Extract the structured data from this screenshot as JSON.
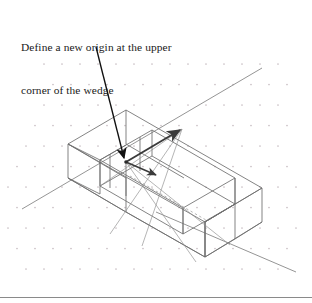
{
  "figure": {
    "kind": "isometric-wireframe-drawing",
    "width": 312,
    "height": 303,
    "background_color": "#ffffff",
    "annotation": {
      "line1": "Define a new origin at the upper",
      "line2": "corner of the wedge",
      "text_color": "#1a1a1a",
      "font_size_px": 11.4
    },
    "colors": {
      "solid_edge": "#4a4a4a",
      "thin_edge": "#7a7a7a",
      "hidden_edge": "#9a9a9a",
      "grid_dot": "#c9bfc4",
      "leader": "#111111",
      "ucs_axis": "#3a3a3a",
      "frame_rule": "#8a8a8a",
      "construction": "#8c8c8c"
    },
    "grid": {
      "type": "isometric-dot-grid",
      "dot_color": "#c9bfc4",
      "dot_radius": 0.85,
      "col_spacing": 18,
      "row_spacing": 20.5,
      "row_offset": 9
    },
    "leader": {
      "label": "leader-to-origin",
      "from_x": 96,
      "from_y": 47,
      "to_x": 126,
      "to_y": 162,
      "arrow_size": 6
    },
    "origin_point": {
      "label": "new-origin-vertex",
      "x": 126,
      "y": 162
    },
    "ucs_axes": [
      {
        "name": "x-axis-arrow",
        "x1": 126,
        "y1": 162,
        "x2": 182,
        "y2": 129,
        "width": 1.9
      },
      {
        "name": "y-axis-arrow",
        "x1": 126,
        "y1": 162,
        "x2": 158,
        "y2": 176,
        "width": 1.6
      }
    ],
    "isometric_axis_line": {
      "name": "long-ground-axis",
      "x1": 22,
      "y1": 209,
      "x2": 262,
      "y2": 68
    },
    "isometric_axis_line_2": {
      "name": "long-ground-axis-lower",
      "x1": 155,
      "y1": 211,
      "x2": 296,
      "y2": 272
    },
    "hidden_edge": {
      "name": "channel-hidden-edge",
      "x1": 130,
      "y1": 176,
      "x2": 205,
      "y2": 219
    },
    "block": {
      "name": "channel-block",
      "description": "rectangular block with longitudinal channel slot"
    }
  }
}
